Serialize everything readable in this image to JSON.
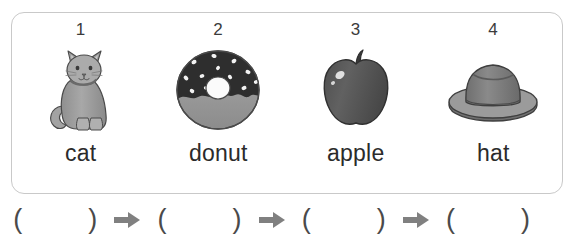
{
  "worksheet": {
    "items": [
      {
        "number": "1",
        "word": "cat",
        "icon": "cat-illustration"
      },
      {
        "number": "2",
        "word": "donut",
        "icon": "donut-illustration"
      },
      {
        "number": "3",
        "word": "apple",
        "icon": "apple-illustration"
      },
      {
        "number": "4",
        "word": "hat",
        "icon": "hat-illustration"
      }
    ]
  },
  "answer_row": {
    "groups": [
      {
        "open": "(",
        "value": "",
        "close": ")",
        "arrow_after": true
      },
      {
        "open": "(",
        "value": "",
        "close": ")",
        "arrow_after": true
      },
      {
        "open": "(",
        "value": "",
        "close": ")",
        "arrow_after": true
      },
      {
        "open": "(",
        "value": "",
        "close": ")",
        "arrow_after": false
      }
    ],
    "arrow_icon": "right-arrow-icon"
  },
  "colors": {
    "card_border": "#c9c9c9",
    "text": "#2b2b2b",
    "number_text": "#3b3b3b",
    "paren": "#4a4a4a",
    "arrow": "#808080",
    "cat_body": "#9e9e9e",
    "donut_frosting": "#2e2e2e",
    "donut_dough": "#9a9a9a",
    "apple_body": "#595959",
    "hat_body": "#7e7e7e"
  }
}
